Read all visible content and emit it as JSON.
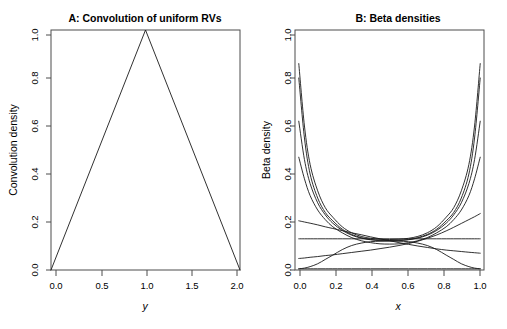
{
  "figure": {
    "width": 507,
    "height": 329,
    "background": "#ffffff",
    "line_color": "#1a1a1a",
    "axis_color": "#4d4d4d"
  },
  "panels": [
    {
      "key": "A",
      "title": "A: Convolution of uniform RVs",
      "xlabel": "y",
      "ylabel": "Convolution density",
      "xticks": [
        "0.0",
        "0.5",
        "1.0",
        "1.5",
        "2.0"
      ],
      "yticks": [
        "0.0",
        "0.2",
        "0.4",
        "0.6",
        "0.8",
        "1.0"
      ]
    },
    {
      "key": "B",
      "title": "B: Beta densities",
      "xlabel": "x",
      "ylabel": "Beta density",
      "xticks": [
        "0.0",
        "0.2",
        "0.4",
        "0.6",
        "0.8",
        "1.0"
      ],
      "yticks": [
        "0.0",
        "0.2",
        "0.4",
        "0.6",
        "0.8",
        "1.0"
      ]
    }
  ],
  "chart_data": [
    {
      "type": "line",
      "panel": "A",
      "title": "A: Convolution of uniform RVs",
      "xlabel": "y",
      "ylabel": "Convolution density",
      "xlim": [
        0.0,
        2.0
      ],
      "ylim": [
        0.0,
        1.0
      ],
      "xticks": [
        0.0,
        0.5,
        1.0,
        1.5,
        2.0
      ],
      "yticks": [
        0.0,
        0.2,
        0.4,
        0.6,
        0.8,
        1.0
      ],
      "grid": false,
      "legend": "none",
      "series": [
        {
          "name": "triangular convolution density",
          "x": [
            0.0,
            1.0,
            2.0
          ],
          "values": [
            0.0,
            1.0,
            0.0
          ]
        }
      ]
    },
    {
      "type": "line",
      "panel": "B",
      "title": "B: Beta densities",
      "xlabel": "x",
      "ylabel": "Beta density",
      "xlim": [
        0.0,
        1.0
      ],
      "ylim": [
        0.0,
        1.0
      ],
      "xticks": [
        0.0,
        0.2,
        0.4,
        0.6,
        0.8,
        1.0
      ],
      "yticks": [
        0.0,
        0.2,
        0.4,
        0.6,
        0.8,
        1.0
      ],
      "grid": false,
      "legend": "none",
      "x": [
        0.02,
        0.05,
        0.08,
        0.12,
        0.16,
        0.2,
        0.25,
        0.3,
        0.35,
        0.4,
        0.45,
        0.5,
        0.55,
        0.6,
        0.65,
        0.7,
        0.75,
        0.8,
        0.84,
        0.88,
        0.92,
        0.95,
        0.98
      ],
      "series": [
        {
          "name": "U-shaped beta (steepest, symmetric)",
          "values": [
            0.86,
            0.6,
            0.44,
            0.33,
            0.26,
            0.22,
            0.18,
            0.155,
            0.14,
            0.132,
            0.128,
            0.127,
            0.128,
            0.132,
            0.14,
            0.155,
            0.18,
            0.22,
            0.26,
            0.33,
            0.44,
            0.6,
            0.86
          ]
        },
        {
          "name": "U-shaped beta (steep, symmetric)",
          "values": [
            0.8,
            0.55,
            0.4,
            0.3,
            0.24,
            0.205,
            0.17,
            0.148,
            0.135,
            0.127,
            0.124,
            0.123,
            0.124,
            0.127,
            0.135,
            0.148,
            0.17,
            0.205,
            0.24,
            0.3,
            0.4,
            0.55,
            0.8
          ]
        },
        {
          "name": "U-shaped beta (moderate, symmetric)",
          "values": [
            0.62,
            0.46,
            0.36,
            0.28,
            0.23,
            0.195,
            0.165,
            0.145,
            0.133,
            0.126,
            0.122,
            0.121,
            0.122,
            0.126,
            0.133,
            0.145,
            0.165,
            0.195,
            0.23,
            0.28,
            0.36,
            0.46,
            0.62
          ]
        },
        {
          "name": "U-shaped beta (shallow, symmetric)",
          "values": [
            0.47,
            0.38,
            0.31,
            0.25,
            0.21,
            0.18,
            0.155,
            0.135,
            0.122,
            0.114,
            0.109,
            0.108,
            0.109,
            0.114,
            0.122,
            0.135,
            0.155,
            0.18,
            0.21,
            0.25,
            0.31,
            0.38,
            0.47
          ]
        },
        {
          "name": "uniform beta (flat, ~0.13)",
          "values": [
            0.13,
            0.13,
            0.13,
            0.13,
            0.13,
            0.13,
            0.13,
            0.13,
            0.13,
            0.13,
            0.13,
            0.13,
            0.13,
            0.13,
            0.13,
            0.13,
            0.13,
            0.13,
            0.13,
            0.13,
            0.13,
            0.13,
            0.13
          ]
        },
        {
          "name": "near-zero beta (flat, ~0.005)",
          "values": [
            0.005,
            0.005,
            0.005,
            0.005,
            0.005,
            0.005,
            0.005,
            0.005,
            0.005,
            0.005,
            0.005,
            0.005,
            0.005,
            0.005,
            0.005,
            0.005,
            0.005,
            0.005,
            0.005,
            0.005,
            0.005,
            0.005,
            0.005
          ]
        },
        {
          "name": "decreasing beta (monotone)",
          "values": [
            0.205,
            0.2,
            0.195,
            0.188,
            0.18,
            0.173,
            0.164,
            0.155,
            0.147,
            0.138,
            0.13,
            0.122,
            0.114,
            0.107,
            0.1,
            0.094,
            0.088,
            0.083,
            0.08,
            0.077,
            0.074,
            0.072,
            0.07
          ]
        },
        {
          "name": "increasing beta (monotone)",
          "values": [
            0.048,
            0.05,
            0.053,
            0.056,
            0.06,
            0.063,
            0.068,
            0.073,
            0.078,
            0.083,
            0.089,
            0.095,
            0.102,
            0.11,
            0.12,
            0.132,
            0.146,
            0.163,
            0.178,
            0.194,
            0.21,
            0.222,
            0.235
          ]
        },
        {
          "name": "unimodal beta (centered bump)",
          "values": [
            0.005,
            0.008,
            0.014,
            0.026,
            0.044,
            0.062,
            0.085,
            0.102,
            0.112,
            0.118,
            0.12,
            0.121,
            0.12,
            0.118,
            0.112,
            0.102,
            0.085,
            0.062,
            0.044,
            0.026,
            0.014,
            0.008,
            0.005
          ]
        }
      ]
    }
  ]
}
